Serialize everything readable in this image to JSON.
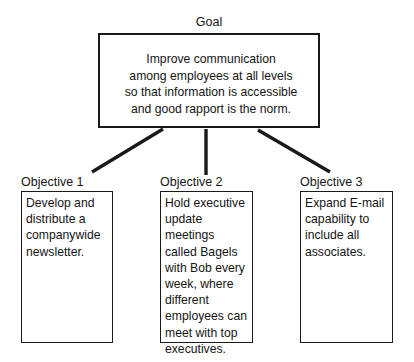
{
  "diagram": {
    "type": "goal-objectives-tree",
    "background_color": "#ffffff",
    "line_color": "#1a1a1a",
    "text_color": "#141414",
    "goal": {
      "label": "Goal",
      "text": "Improve communication\namong employees at all levels\nso that information is accessible\nand good rapport is the norm.",
      "lines": [
        "Improve communication",
        "among employees at all levels",
        "so that information is accessible",
        "and good rapport is the norm."
      ]
    },
    "objectives": [
      {
        "label": "Objective 1",
        "text": "Develop and\ndistribute a\ncompanywide\nnewsletter.",
        "lines": [
          "Develop and",
          "distribute a",
          "companywide",
          "newsletter."
        ]
      },
      {
        "label": "Objective 2",
        "text": "Hold executive\nupdate\nmeetings\ncalled Bagels\nwith Bob every\nweek, where\ndifferent\nemployees can\nmeet with top\nexecutives.",
        "lines": [
          "Hold executive",
          "update",
          "meetings",
          "called Bagels",
          "with Bob every",
          "week, where",
          "different",
          "employees can",
          "meet with top",
          "executives."
        ]
      },
      {
        "label": "Objective 3",
        "text": "Expand E-mail\ncapability to\ninclude all\nassociates.",
        "lines": [
          "Expand E-mail",
          "capability to",
          "include all",
          "associates."
        ]
      }
    ],
    "connectors": [
      {
        "name": "goal-to-objective-1",
        "from": [
          163,
          129
        ],
        "to": [
          92,
          172
        ]
      },
      {
        "name": "goal-to-objective-2",
        "from": [
          206,
          129
        ],
        "to": [
          206,
          175
        ]
      },
      {
        "name": "goal-to-objective-3",
        "from": [
          258,
          130
        ],
        "to": [
          330,
          172
        ]
      }
    ]
  }
}
